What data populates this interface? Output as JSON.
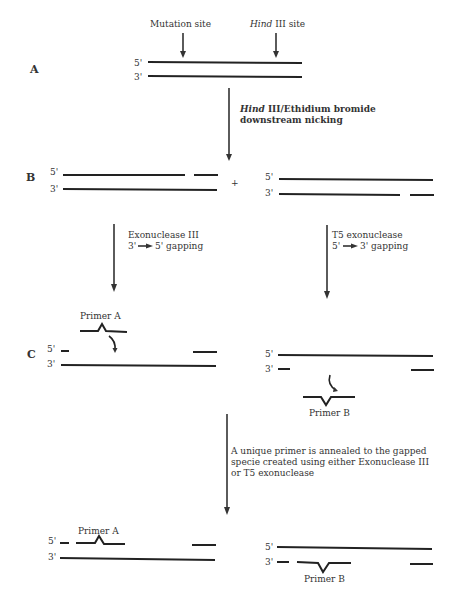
{
  "diagram": {
    "steps": {
      "A": {
        "label": "A",
        "strand_top_end": "5'",
        "strand_bottom_end": "3'",
        "site_labels": {
          "mutation": "Mutation site",
          "hind_italic": "Hind",
          "hind_rest": " III site"
        }
      },
      "step_A_to_B": {
        "line1_italic": "Hind",
        "line1_rest": " III/Ethidium bromide",
        "line2": "downstream nicking"
      },
      "B": {
        "label": "B",
        "left": {
          "top_end": "5'",
          "bottom_end": "3'"
        },
        "plus": "+",
        "right": {
          "top_end": "5'",
          "bottom_end": "3'"
        }
      },
      "step_B_to_C": {
        "left": {
          "line1": "Exonuclease III",
          "line2_from": "3'",
          "line2_to": "5' gapping"
        },
        "right": {
          "line1": "T5 exonuclease",
          "line2_from": "5'",
          "line2_to": "3' gapping"
        }
      },
      "C": {
        "label": "C",
        "left": {
          "top_end": "5'",
          "bottom_end": "3'",
          "primer_label": "Primer A"
        },
        "right": {
          "top_end": "5'",
          "bottom_end": "3'",
          "primer_label": "Primer B"
        }
      },
      "step_C_to_D": {
        "line1": "A unique primer is annealed to the gapped",
        "line2": "specie created using either Exonuclease III",
        "line3": "or T5 exonuclease"
      },
      "D": {
        "left": {
          "top_end": "5'",
          "bottom_end": "3'",
          "primer_label": "Primer A"
        },
        "right": {
          "top_end": "5'",
          "bottom_end": "3'",
          "primer_label": "Primer B"
        }
      }
    },
    "colors": {
      "strand": "#222222",
      "text": "#333333",
      "background": "#ffffff"
    }
  }
}
